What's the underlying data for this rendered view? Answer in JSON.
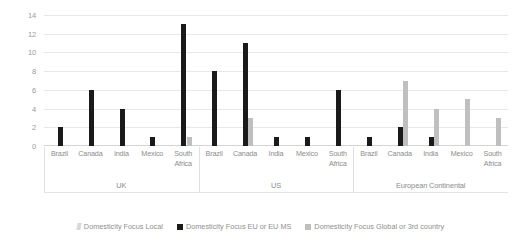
{
  "chart_data": {
    "type": "bar",
    "title": "",
    "subtitle": "",
    "xlabel": "",
    "ylabel": "",
    "ylim": [
      0,
      14
    ],
    "yticks": [
      0,
      2,
      4,
      6,
      8,
      10,
      12,
      14
    ],
    "grid": true,
    "legend_position": "bottom",
    "categories": [
      "Brazil",
      "Canada",
      "India",
      "Mexico",
      "South Africa"
    ],
    "groups": [
      "UK",
      "US",
      "European Continental"
    ],
    "series": [
      {
        "name": "Domesticity Focus Local",
        "color": "#d9d9d9",
        "values_by_group": {
          "UK": [
            0,
            0,
            0,
            0,
            0
          ],
          "US": [
            0,
            0,
            0,
            0,
            0
          ],
          "European Continental": [
            0,
            0,
            0,
            0,
            0
          ]
        }
      },
      {
        "name": "Domesticity Focus EU or EU MS",
        "color": "#1a1a1a",
        "values_by_group": {
          "UK": [
            2,
            6,
            4,
            1,
            13
          ],
          "US": [
            8,
            11,
            1,
            1,
            6
          ],
          "European Continental": [
            1,
            2,
            1,
            0,
            0
          ]
        }
      },
      {
        "name": "Domesticity Focus Global or 3rd country",
        "color": "#bfbfbf",
        "values_by_group": {
          "UK": [
            0,
            0,
            0,
            0,
            1
          ],
          "US": [
            0,
            3,
            0,
            0,
            0
          ],
          "European Continental": [
            0,
            7,
            4,
            5,
            3
          ]
        }
      }
    ]
  },
  "axis": {
    "y_tick_labels": [
      "14",
      "12",
      "10",
      "8",
      "6",
      "4",
      "2",
      "0"
    ]
  },
  "categories_flat": [
    "Brazil",
    "Canada",
    "India",
    "Mexico",
    "South Africa",
    "Brazil",
    "Canada",
    "India",
    "Mexico",
    "South Africa",
    "Brazil",
    "Canada",
    "India",
    "Mexico",
    "South Africa"
  ],
  "groups": [
    {
      "label": "UK"
    },
    {
      "label": "US"
    },
    {
      "label": "European Continental"
    }
  ],
  "legend": {
    "items": [
      {
        "label": "Domesticity Focus Local",
        "swatch": "local-swatch-icon"
      },
      {
        "label": "Domesticity Focus EU or EU MS",
        "swatch": "eu-swatch-icon"
      },
      {
        "label": "Domesticity Focus Global or 3rd country",
        "swatch": "global-swatch-icon"
      }
    ]
  },
  "colors": {
    "series_local": "#d9d9d9",
    "series_eu": "#1a1a1a",
    "series_global": "#bfbfbf",
    "gridline": "#e8e8e8",
    "text": "#8c8c8c"
  }
}
